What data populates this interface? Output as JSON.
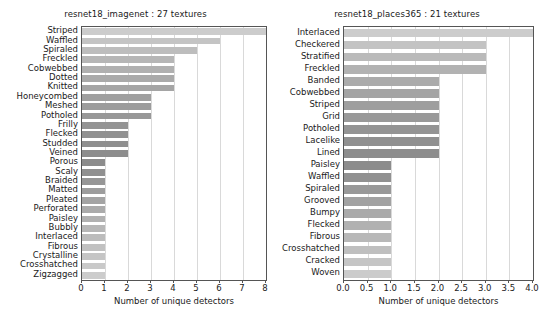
{
  "figure": {
    "width": 543,
    "height": 330,
    "background": "#ffffff"
  },
  "chart_data": [
    {
      "type": "bar",
      "orientation": "horizontal",
      "title": "resnet18_imagenet : 27 textures",
      "xlabel": "Number of unique detectors",
      "ylabel": "",
      "xlim": [
        0,
        8
      ],
      "xticks": [
        "0",
        "1",
        "2",
        "3",
        "4",
        "5",
        "6",
        "7",
        "8"
      ],
      "xtick_values": [
        0,
        1,
        2,
        3,
        4,
        5,
        6,
        7,
        8
      ],
      "grid": true,
      "grid_axis": "x",
      "legend": null,
      "categories": [
        "Striped",
        "Waffled",
        "Spiraled",
        "Freckled",
        "Cobwebbed",
        "Dotted",
        "Knitted",
        "Honeycombed",
        "Meshed",
        "Potholed",
        "Frilly",
        "Flecked",
        "Studded",
        "Veined",
        "Porous",
        "Scaly",
        "Braided",
        "Matted",
        "Pleated",
        "Perforated",
        "Paisley",
        "Bubbly",
        "Interlaced",
        "Fibrous",
        "Crystalline",
        "Crosshatched",
        "Zigzagged"
      ],
      "values": [
        8,
        6,
        5,
        4,
        4,
        4,
        4,
        3,
        3,
        3,
        2,
        2,
        2,
        2,
        1,
        1,
        1,
        1,
        1,
        1,
        1,
        1,
        1,
        1,
        1,
        1,
        1
      ],
      "bar_colors": [
        "#cccccc",
        "#c4c4c4",
        "#bdbdbd",
        "#b6b6b6",
        "#b0b0b0",
        "#aaaaaa",
        "#a5a5a5",
        "#a0a0a0",
        "#9c9c9c",
        "#989898",
        "#949494",
        "#919191",
        "#8f8f8f",
        "#8d8d8d",
        "#8c8c8c",
        "#909090",
        "#969696",
        "#9d9d9d",
        "#a4a4a4",
        "#ababab",
        "#b1b1b1",
        "#b7b7b7",
        "#bcbcbc",
        "#c1c1c1",
        "#c5c5c5",
        "#c9c9c9",
        "#cccccc"
      ]
    },
    {
      "type": "bar",
      "orientation": "horizontal",
      "title": "resnet18_places365 : 21 textures",
      "xlabel": "Number of unique detectors",
      "ylabel": "",
      "xlim": [
        0,
        4
      ],
      "xticks": [
        "0.0",
        "0.5",
        "1.0",
        "1.5",
        "2.0",
        "2.5",
        "3.0",
        "3.5",
        "4.0"
      ],
      "xtick_values": [
        0,
        0.5,
        1.0,
        1.5,
        2.0,
        2.5,
        3.0,
        3.5,
        4.0
      ],
      "grid": true,
      "grid_axis": "x",
      "legend": null,
      "categories": [
        "Interlaced",
        "Checkered",
        "Stratified",
        "Freckled",
        "Banded",
        "Cobwebbed",
        "Striped",
        "Grid",
        "Potholed",
        "Lacelike",
        "Lined",
        "Paisley",
        "Waffled",
        "Spiraled",
        "Grooved",
        "Bumpy",
        "Flecked",
        "Fibrous",
        "Crosshatched",
        "Cracked",
        "Woven"
      ],
      "values": [
        4,
        3,
        3,
        3,
        2,
        2,
        2,
        2,
        2,
        2,
        2,
        1,
        1,
        1,
        1,
        1,
        1,
        1,
        1,
        1,
        1
      ],
      "bar_colors": [
        "#cccccc",
        "#c3c3c3",
        "#bababa",
        "#b2b2b2",
        "#ababab",
        "#a4a4a4",
        "#9e9e9e",
        "#999999",
        "#949494",
        "#909090",
        "#8d8d8d",
        "#8c8c8c",
        "#919191",
        "#999999",
        "#a2a2a2",
        "#aaaaaa",
        "#b1b1b1",
        "#b8b8b8",
        "#bfbfbf",
        "#c5c5c5",
        "#cbcbcb"
      ]
    }
  ]
}
